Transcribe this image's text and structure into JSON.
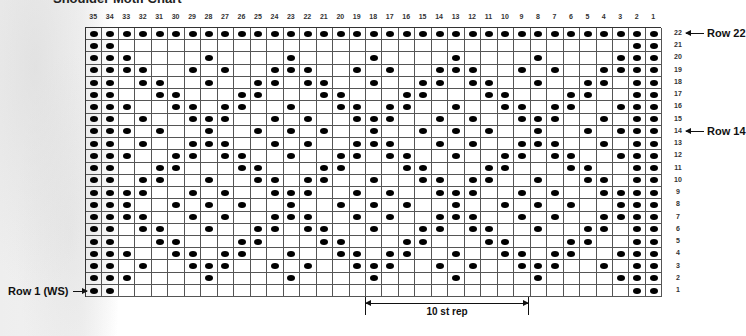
{
  "title": "Shoulder Motif Chart",
  "columns": [
    35,
    34,
    33,
    32,
    31,
    30,
    29,
    28,
    27,
    26,
    25,
    24,
    23,
    22,
    21,
    20,
    19,
    18,
    17,
    16,
    15,
    14,
    13,
    12,
    11,
    10,
    9,
    8,
    7,
    6,
    5,
    4,
    3,
    2,
    1
  ],
  "row_numbers": [
    22,
    21,
    20,
    19,
    18,
    17,
    16,
    15,
    14,
    13,
    12,
    11,
    10,
    9,
    8,
    7,
    6,
    5,
    4,
    3,
    2,
    1
  ],
  "callouts": {
    "row22": "Row 22",
    "row14": "Row 14",
    "row1": "Row 1 (WS)"
  },
  "repeat": {
    "label": "10 st rep",
    "from_col": 18,
    "to_col": 9
  },
  "legend": {
    "dot": "filled dot",
    "blank": "empty square"
  },
  "chart_data": {
    "type": "table",
    "title": "Shoulder Motif Chart",
    "n_columns": 35,
    "n_rows": 22,
    "column_order_left_to_right": [
      35,
      1
    ],
    "filled": {
      "22": [
        35,
        34,
        33,
        32,
        31,
        30,
        29,
        28,
        27,
        26,
        25,
        24,
        23,
        22,
        21,
        20,
        19,
        18,
        17,
        16,
        15,
        14,
        13,
        12,
        11,
        10,
        9,
        8,
        7,
        6,
        5,
        4,
        3,
        2,
        1
      ],
      "21": [
        35,
        34,
        2,
        1
      ],
      "20": [
        35,
        34,
        33,
        28,
        23,
        18,
        13,
        8,
        3,
        2,
        1
      ],
      "19": [
        35,
        34,
        33,
        32,
        29,
        27,
        24,
        23,
        22,
        19,
        17,
        14,
        13,
        12,
        9,
        7,
        4,
        3,
        2,
        1
      ],
      "18": [
        35,
        34,
        32,
        31,
        28,
        25,
        24,
        22,
        21,
        18,
        15,
        14,
        12,
        11,
        8,
        5,
        4,
        2,
        1
      ],
      "17": [
        35,
        34,
        31,
        30,
        26,
        25,
        21,
        20,
        16,
        15,
        11,
        10,
        6,
        5,
        2,
        1
      ],
      "16": [
        35,
        34,
        33,
        30,
        29,
        27,
        26,
        23,
        20,
        19,
        17,
        16,
        13,
        10,
        9,
        7,
        6,
        3,
        2,
        1
      ],
      "15": [
        35,
        34,
        32,
        29,
        28,
        27,
        24,
        22,
        19,
        18,
        17,
        14,
        12,
        9,
        8,
        7,
        4,
        2,
        1
      ],
      "14": [
        35,
        34,
        33,
        31,
        28,
        25,
        23,
        21,
        18,
        15,
        13,
        11,
        8,
        5,
        3,
        2,
        1
      ],
      "13": [
        35,
        34,
        32,
        29,
        28,
        27,
        24,
        22,
        19,
        18,
        17,
        14,
        12,
        9,
        8,
        7,
        4,
        2,
        1
      ],
      "12": [
        35,
        34,
        33,
        30,
        29,
        27,
        26,
        23,
        20,
        19,
        17,
        16,
        13,
        10,
        9,
        7,
        6,
        3,
        2,
        1
      ],
      "11": [
        35,
        34,
        31,
        30,
        26,
        25,
        21,
        20,
        16,
        15,
        11,
        10,
        6,
        5,
        2,
        1
      ],
      "10": [
        35,
        34,
        32,
        31,
        28,
        25,
        24,
        22,
        21,
        18,
        15,
        14,
        12,
        11,
        8,
        5,
        4,
        2,
        1
      ],
      "9": [
        35,
        34,
        33,
        32,
        29,
        27,
        24,
        23,
        22,
        19,
        17,
        14,
        13,
        12,
        9,
        7,
        4,
        3,
        2,
        1
      ],
      "8": [
        35,
        34,
        33,
        30,
        28,
        26,
        23,
        20,
        18,
        16,
        13,
        10,
        8,
        6,
        3,
        2,
        1
      ],
      "7": [
        35,
        34,
        33,
        32,
        29,
        27,
        24,
        23,
        22,
        19,
        17,
        14,
        13,
        12,
        9,
        7,
        4,
        3,
        2,
        1
      ],
      "6": [
        35,
        34,
        32,
        31,
        28,
        25,
        24,
        22,
        21,
        18,
        15,
        14,
        12,
        11,
        8,
        5,
        4,
        2,
        1
      ],
      "5": [
        35,
        34,
        31,
        30,
        26,
        25,
        21,
        20,
        16,
        15,
        11,
        10,
        6,
        5,
        2,
        1
      ],
      "4": [
        35,
        34,
        33,
        30,
        29,
        27,
        26,
        23,
        20,
        19,
        17,
        16,
        13,
        10,
        9,
        7,
        6,
        3,
        2,
        1
      ],
      "3": [
        35,
        34,
        32,
        29,
        28,
        27,
        24,
        22,
        19,
        18,
        17,
        14,
        12,
        9,
        8,
        7,
        4,
        2,
        1
      ],
      "2": [
        35,
        34,
        33,
        28,
        23,
        18,
        13,
        8,
        3,
        2,
        1
      ],
      "1": [
        35,
        34,
        2,
        1
      ]
    },
    "annotations": [
      "Row 22",
      "Row 14",
      "Row 1 (WS)",
      "10 st rep (cols 18-9)"
    ]
  }
}
